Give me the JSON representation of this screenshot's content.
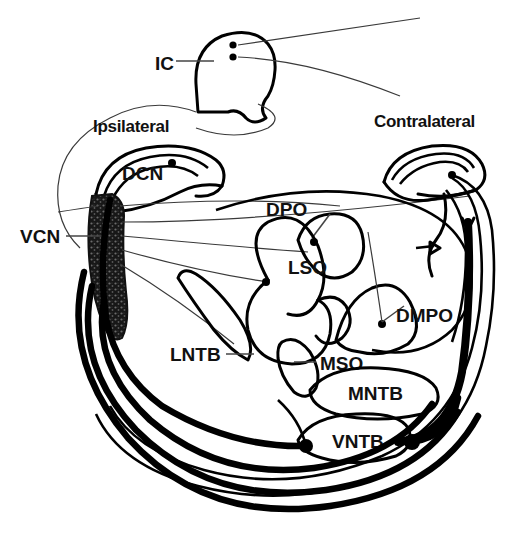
{
  "figure": {
    "background_color": "#ffffff",
    "ink_color": "#000000"
  },
  "side_labels": [
    {
      "id": "ipsilateral",
      "text": "Ipsilateral",
      "x": 93,
      "y": 132
    },
    {
      "id": "contralateral",
      "text": "Contralateral",
      "x": 374,
      "y": 127
    }
  ],
  "structures": [
    {
      "id": "ic",
      "abbr": "IC",
      "name": "Inferior colliculus",
      "label_x": 157,
      "label_y": 66,
      "has_leader": true
    },
    {
      "id": "dcn",
      "abbr": "DCN",
      "name": "Dorsal cochlear nucleus",
      "label_x": 122,
      "label_y": 180,
      "has_leader": false
    },
    {
      "id": "vcn",
      "abbr": "VCN",
      "name": "Ventral cochlear nucleus",
      "label_x": 20,
      "label_y": 240,
      "has_leader": true,
      "shaded": true
    },
    {
      "id": "dpo",
      "abbr": "DPO",
      "name": "Dorsal periolivary nucleus",
      "label_x": 268,
      "label_y": 216,
      "has_leader": true
    },
    {
      "id": "lso",
      "abbr": "LSO",
      "name": "Lateral superior olive",
      "label_x": 290,
      "label_y": 272,
      "has_leader": false
    },
    {
      "id": "dmpo",
      "abbr": "DMPO",
      "name": "Dorsomedial periolivary nucleus",
      "label_x": 396,
      "label_y": 318,
      "has_leader": true
    },
    {
      "id": "lntb",
      "abbr": "LNTB",
      "name": "Lateral nucleus of trapezoid body",
      "label_x": 173,
      "label_y": 358,
      "has_leader": true
    },
    {
      "id": "mso",
      "abbr": "MSO",
      "name": "Medial superior olive",
      "label_x": 320,
      "label_y": 366,
      "has_leader": true
    },
    {
      "id": "mntb",
      "abbr": "MNTB",
      "name": "Medial nucleus of trapezoid body",
      "label_x": 352,
      "label_y": 397,
      "has_leader": false
    },
    {
      "id": "vntb",
      "abbr": "VNTB",
      "name": "Ventral nucleus of trapezoid body",
      "label_x": 336,
      "label_y": 443,
      "has_leader": false
    }
  ]
}
